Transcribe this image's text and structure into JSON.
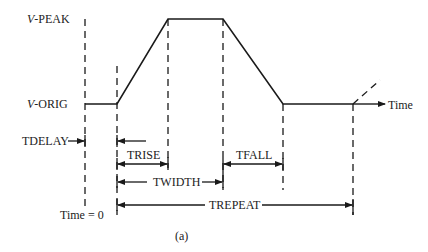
{
  "diagram": {
    "type": "pulse-waveform",
    "caption": "(a)",
    "levels": {
      "v_peak": {
        "prefix": "V",
        "suffix": "-PEAK"
      },
      "v_orig": {
        "prefix": "V",
        "suffix": "-ORIG"
      }
    },
    "axis": {
      "time_label": "Time",
      "time_zero_label": "Time = 0"
    },
    "intervals": {
      "tdelay": "TDELAY",
      "trise": "TRISE",
      "twidth": "TWIDTH",
      "tfall": "TFALL",
      "trepeat": "TREPEAT"
    },
    "colors": {
      "line": "#1a1a1a",
      "background": "#ffffff"
    }
  }
}
